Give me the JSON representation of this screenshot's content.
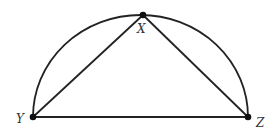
{
  "diagram": {
    "type": "geometry",
    "stroke_color": "#222222",
    "points": {
      "X": {
        "label": "X",
        "x": 143,
        "y": 15
      },
      "Y": {
        "label": "Y",
        "x": 33,
        "y": 117
      },
      "Z": {
        "label": "Z",
        "x": 248,
        "y": 117
      }
    },
    "segments": [
      "YX",
      "XZ",
      "YZ"
    ],
    "arc": {
      "type": "semicircle",
      "diameter": "YZ"
    }
  }
}
